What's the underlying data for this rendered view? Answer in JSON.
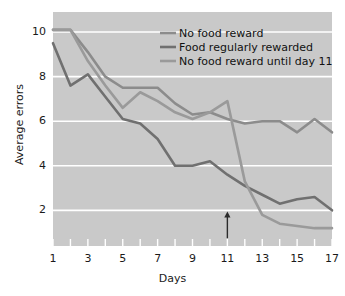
{
  "chart_data": {
    "type": "line",
    "title": "",
    "xlabel": "Days",
    "ylabel": "Average errors",
    "x": [
      1,
      2,
      3,
      4,
      5,
      6,
      7,
      8,
      9,
      10,
      11,
      12,
      13,
      14,
      15,
      16,
      17
    ],
    "xlim": [
      1,
      17
    ],
    "ylim": [
      0.4,
      10.9
    ],
    "xticks": [
      1,
      2,
      3,
      4,
      5,
      6,
      7,
      8,
      9,
      10,
      11,
      12,
      13,
      14,
      15,
      16,
      17
    ],
    "xticklabels": [
      "1",
      "",
      "3",
      "",
      "5",
      "",
      "7",
      "",
      "9",
      "",
      "11",
      "",
      "13",
      "",
      "15",
      "",
      "17"
    ],
    "yticks": [
      2,
      4,
      6,
      8,
      10
    ],
    "yticklabels": [
      "2",
      "4",
      "6",
      "8",
      "10"
    ],
    "grid": "horizontal-white",
    "legend_position": "top-right-inside",
    "series": [
      {
        "name": "No food reward",
        "color": "#8c8c8c",
        "values": [
          10.1,
          10.1,
          9.1,
          8.0,
          7.5,
          7.5,
          7.5,
          6.8,
          6.3,
          6.4,
          6.1,
          5.9,
          6.0,
          6.0,
          5.5,
          6.1,
          5.5
        ]
      },
      {
        "name": "Food regularly rewarded",
        "color": "#707070",
        "values": [
          9.5,
          7.6,
          8.1,
          7.1,
          6.1,
          5.9,
          5.2,
          4.0,
          4.0,
          4.2,
          3.6,
          3.1,
          2.7,
          2.3,
          2.5,
          2.6,
          2.0
        ]
      },
      {
        "name": "No food reward until day 11",
        "color": "#9a9a9a",
        "values": [
          10.1,
          10.1,
          8.7,
          7.6,
          6.6,
          7.3,
          6.9,
          6.4,
          6.1,
          6.4,
          6.9,
          3.3,
          1.8,
          1.4,
          1.3,
          1.2,
          1.2
        ]
      }
    ],
    "annotation": {
      "type": "arrow-up",
      "at_day": 11,
      "color": "#2b2b2b",
      "y_tail": 0.75,
      "y_head": 1.95
    }
  },
  "colors": {
    "plot_background": "#c9c9c9",
    "page_background": "#ffffff",
    "gridline": "#ffffff",
    "text": "#1a1a1a"
  },
  "legend": {
    "items": [
      {
        "label": "No food reward"
      },
      {
        "label": "Food regularly rewarded"
      },
      {
        "label": "No food reward until day 11"
      }
    ]
  }
}
